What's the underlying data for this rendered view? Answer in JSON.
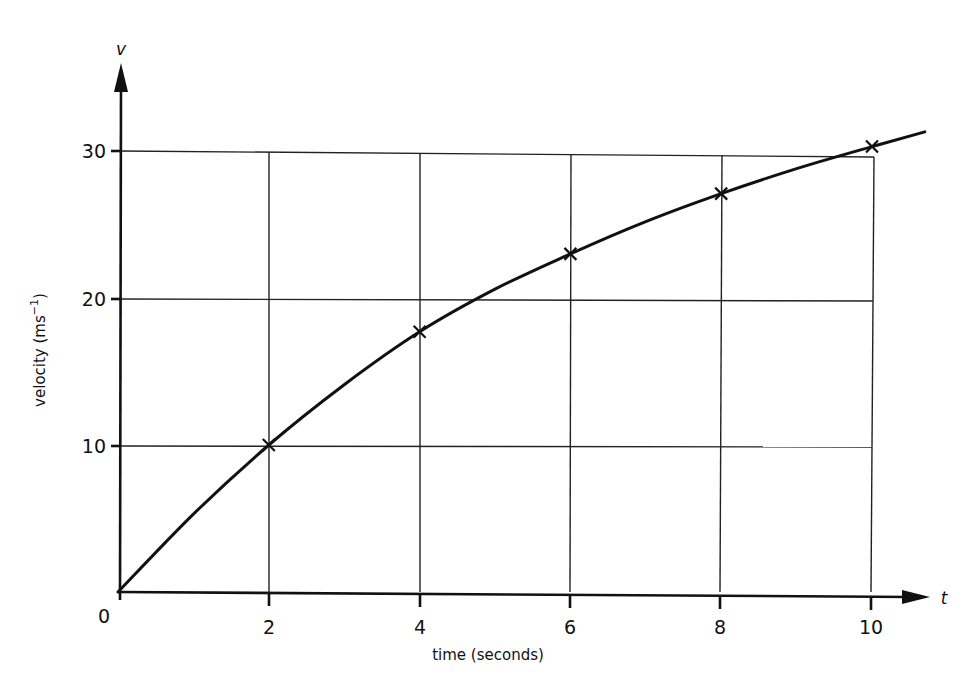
{
  "chart_data": {
    "type": "line",
    "title": "",
    "xlabel": "time (seconds)",
    "ylabel": "velocity (ms⁻¹)",
    "x_axis_symbol": "t",
    "y_axis_symbol": "v",
    "xlim": [
      0,
      10.7
    ],
    "ylim": [
      0,
      35
    ],
    "x_ticks": [
      0,
      2,
      4,
      6,
      8,
      10
    ],
    "y_ticks": [
      10,
      20,
      30
    ],
    "grid": true,
    "legend": null,
    "series": [
      {
        "name": "velocity",
        "marker": "x",
        "x": [
          2,
          4,
          6,
          8,
          10
        ],
        "values": [
          10,
          17.7,
          23,
          27.1,
          30.3
        ]
      }
    ],
    "curve": {
      "x": [
        0,
        1,
        2,
        3,
        4,
        5,
        6,
        7,
        8,
        9,
        10,
        10.7
      ],
      "values": [
        0,
        5.3,
        10,
        14.1,
        17.7,
        20.6,
        23,
        25.2,
        27.1,
        28.8,
        30.3,
        31.3
      ]
    },
    "colors": {
      "line": "#111111",
      "grid": "#222222",
      "background": "#ffffff"
    }
  },
  "labels": {
    "origin": "0",
    "x_ticks": [
      "2",
      "4",
      "6",
      "8",
      "10"
    ],
    "y_ticks": [
      "10",
      "20",
      "30"
    ],
    "xlabel": "time (seconds)",
    "ylabel_main": "velocity (ms",
    "ylabel_sup": "−1",
    "ylabel_close": ")",
    "x_symbol": "t",
    "y_symbol": "v"
  }
}
